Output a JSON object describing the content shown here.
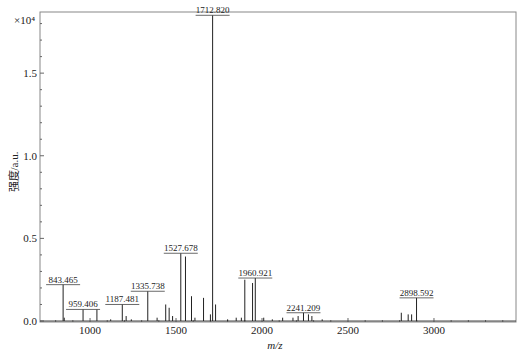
{
  "chart_data": {
    "type": "bar",
    "subtype": "mass-spectrum-stick",
    "title": "",
    "xlabel": "m/z",
    "ylabel": "强度/a.u.",
    "y_multiplier": "×10⁴",
    "xlim": [
      709,
      3477
    ],
    "ylim": [
      0,
      1.87
    ],
    "xticks": [
      1000,
      1500,
      2000,
      2500,
      3000
    ],
    "yticks": [
      0.0,
      0.5,
      1.0,
      1.5
    ],
    "ytick_labels": [
      "0.0",
      "0.5",
      "1.0",
      "1.5"
    ],
    "grid": false,
    "legend": null,
    "labeled_peaks": [
      {
        "mz": 843.465,
        "label": "843.465",
        "intensity": 0.22
      },
      {
        "mz": 959.406,
        "label": "959.406",
        "intensity": 0.07
      },
      {
        "mz": 1187.481,
        "label": "1187.481",
        "intensity": 0.1
      },
      {
        "mz": 1335.738,
        "label": "1335.738",
        "intensity": 0.18
      },
      {
        "mz": 1527.678,
        "label": "1527.678",
        "intensity": 0.41
      },
      {
        "mz": 1712.82,
        "label": "1712.820",
        "intensity": 1.85
      },
      {
        "mz": 1960.921,
        "label": "1960.921",
        "intensity": 0.26
      },
      {
        "mz": 2241.209,
        "label": "2241.209",
        "intensity": 0.05
      },
      {
        "mz": 2898.592,
        "label": "2898.592",
        "intensity": 0.14
      }
    ],
    "other_peaks": [
      {
        "mz": 850,
        "intensity": 0.02
      },
      {
        "mz": 1040,
        "intensity": 0.07
      },
      {
        "mz": 1120,
        "intensity": 0.01
      },
      {
        "mz": 1210,
        "intensity": 0.03
      },
      {
        "mz": 1240,
        "intensity": 0.01
      },
      {
        "mz": 1390,
        "intensity": 0.02
      },
      {
        "mz": 1440,
        "intensity": 0.1
      },
      {
        "mz": 1460,
        "intensity": 0.08
      },
      {
        "mz": 1480,
        "intensity": 0.03
      },
      {
        "mz": 1555,
        "intensity": 0.39
      },
      {
        "mz": 1590,
        "intensity": 0.15
      },
      {
        "mz": 1610,
        "intensity": 0.02
      },
      {
        "mz": 1660,
        "intensity": 0.14
      },
      {
        "mz": 1700,
        "intensity": 0.04
      },
      {
        "mz": 1730,
        "intensity": 0.1
      },
      {
        "mz": 1800,
        "intensity": 0.01
      },
      {
        "mz": 1850,
        "intensity": 0.02
      },
      {
        "mz": 1880,
        "intensity": 0.02
      },
      {
        "mz": 1900,
        "intensity": 0.25
      },
      {
        "mz": 1945,
        "intensity": 0.23
      },
      {
        "mz": 2010,
        "intensity": 0.02
      },
      {
        "mz": 2060,
        "intensity": 0.01
      },
      {
        "mz": 2120,
        "intensity": 0.02
      },
      {
        "mz": 2180,
        "intensity": 0.02
      },
      {
        "mz": 2210,
        "intensity": 0.03
      },
      {
        "mz": 2270,
        "intensity": 0.04
      },
      {
        "mz": 2290,
        "intensity": 0.03
      },
      {
        "mz": 2350,
        "intensity": 0.01
      },
      {
        "mz": 2810,
        "intensity": 0.05
      },
      {
        "mz": 2850,
        "intensity": 0.04
      },
      {
        "mz": 2870,
        "intensity": 0.04
      }
    ]
  }
}
